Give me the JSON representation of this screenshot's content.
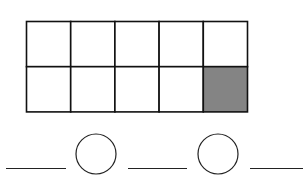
{
  "figure": {
    "grid": {
      "rows": 2,
      "cols": 5,
      "shaded_cells": [
        {
          "row": 1,
          "col": 4
        }
      ],
      "shaded_count": 1,
      "unshaded_count": 9,
      "total_cells": 10,
      "line_color": "#111111",
      "fill_color": "#ffffff",
      "shaded_color": "#848484"
    },
    "sentence": {
      "items": [
        {
          "type": "blank",
          "name": "answer-blank-1"
        },
        {
          "type": "circle",
          "name": "operator-circle-1"
        },
        {
          "type": "blank",
          "name": "answer-blank-2"
        },
        {
          "type": "circle",
          "name": "operator-circle-2"
        },
        {
          "type": "blank",
          "name": "answer-blank-3"
        }
      ],
      "line_color": "#222222"
    }
  }
}
